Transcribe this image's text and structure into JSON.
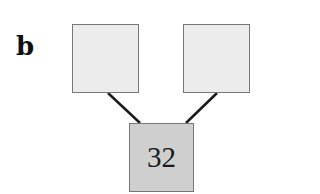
{
  "panel_label": "b",
  "nodes": [
    {
      "id": "left-parent",
      "value": "",
      "x": 72,
      "y": 24,
      "w": 67,
      "h": 69
    },
    {
      "id": "right-parent",
      "value": "",
      "x": 183,
      "y": 24,
      "w": 67,
      "h": 69
    },
    {
      "id": "child",
      "value": "32",
      "x": 129,
      "y": 123,
      "w": 65,
      "h": 69
    }
  ],
  "edges": [
    {
      "from": "left-parent",
      "to": "child"
    },
    {
      "from": "right-parent",
      "to": "child"
    }
  ],
  "colors": {
    "empty_fill": "#ececec",
    "filled_fill": "#cfcfcf",
    "border": "#777777",
    "edge": "#1a1a1a"
  }
}
